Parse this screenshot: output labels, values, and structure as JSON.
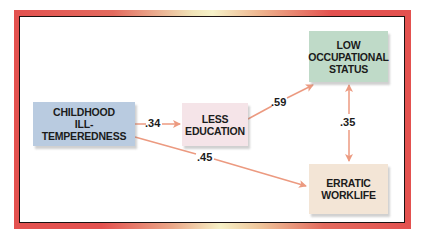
{
  "diagram": {
    "type": "path-diagram",
    "nodes": [
      {
        "id": "childhood",
        "label": "CHILDHOOD\nILL-TEMPEREDNESS",
        "color": "#b9cbe0"
      },
      {
        "id": "education",
        "label": "LESS\nEDUCATION",
        "color": "#f5e4e8"
      },
      {
        "id": "occupation",
        "label": "LOW\nOCCUPATIONAL\nSTATUS",
        "color": "#bfdac8"
      },
      {
        "id": "worklife",
        "label": "ERRATIC\nWORKLIFE",
        "color": "#f3e5d6"
      }
    ],
    "edges": [
      {
        "from": "childhood",
        "to": "education",
        "label": ".34",
        "direction": "forward"
      },
      {
        "from": "education",
        "to": "occupation",
        "label": ".59",
        "direction": "forward"
      },
      {
        "from": "occupation",
        "to": "worklife",
        "label": ".35",
        "direction": "both"
      },
      {
        "from": "childhood",
        "to": "worklife",
        "label": ".45",
        "direction": "forward"
      }
    ],
    "colors": {
      "frame": "#e3514f",
      "arrow": "#ec9a80",
      "text": "#1b1b1b"
    }
  }
}
